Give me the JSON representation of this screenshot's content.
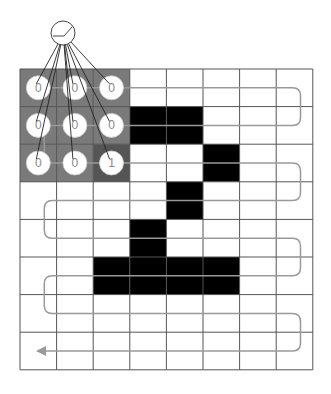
{
  "diagram": {
    "grid": {
      "rows": 8,
      "cols": 8,
      "x0": 20,
      "y0": 69,
      "cell_w": 36.6,
      "cell_h": 37.6,
      "line_color": "#555555",
      "black_cells": [
        [
          1,
          3
        ],
        [
          1,
          4
        ],
        [
          2,
          5
        ],
        [
          3,
          4
        ],
        [
          4,
          3
        ],
        [
          5,
          2
        ],
        [
          5,
          3
        ],
        [
          5,
          4
        ],
        [
          5,
          5
        ]
      ]
    },
    "kernel": {
      "rows": 3,
      "cols": 3,
      "position": [
        0,
        0
      ],
      "fill_color": "#7a7a7a",
      "active_fill_color": "#555555",
      "values": [
        [
          "0",
          "0",
          "0"
        ],
        [
          "0",
          "0",
          "0"
        ],
        [
          "0",
          "0",
          "1"
        ]
      ]
    },
    "neuron": {
      "cx": 63,
      "cy": 33,
      "r": 12,
      "activation_icon": "relu-icon"
    },
    "scan_path": {
      "color": "#999999",
      "direction": "serpentine",
      "end_arrow": "left"
    },
    "colors": {
      "black_cell": "#000000",
      "white_cell": "#ffffff",
      "connection_line": "#222222"
    }
  }
}
